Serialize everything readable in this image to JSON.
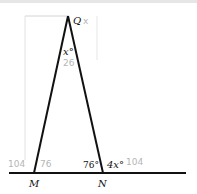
{
  "diagram": {
    "type": "geometry-triangle",
    "points": {
      "Q": {
        "label": "Q"
      },
      "M": {
        "label": "M"
      },
      "N": {
        "label": "N"
      }
    },
    "angles": {
      "at_Q": "x°",
      "interior_N": "76°",
      "exterior_N": "4x°"
    },
    "handwritten_notes": {
      "near_Q": "x",
      "under_x": "26",
      "left_of_M": "104",
      "right_of_M": "76",
      "right_of_4x": "104"
    },
    "colors": {
      "lines": "#111111",
      "pencil": "#b5b5b5"
    }
  }
}
